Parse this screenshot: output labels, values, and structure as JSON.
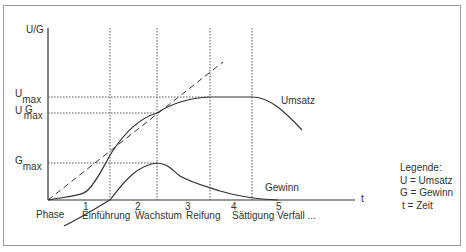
{
  "diagram": {
    "y_axis_label": "U/G",
    "x_axis_label": "t",
    "y_markers": [
      {
        "main": "U",
        "sub": "max"
      },
      {
        "main": "U",
        "main2": "G",
        "sub": "max"
      },
      {
        "main": "G",
        "sub": "max"
      }
    ],
    "phase_label": "Phase",
    "phases": [
      {
        "num": "1",
        "name": "Einführung"
      },
      {
        "num": "2",
        "name": "Wachstum"
      },
      {
        "num": "3",
        "name": "Reifung"
      },
      {
        "num": "4",
        "name": "Sättigung"
      },
      {
        "num": "5",
        "name": "Verfall ..."
      }
    ],
    "curve_labels": {
      "umsatz": "Umsatz",
      "gewinn": "Gewinn"
    },
    "legend": {
      "title": "Legende:",
      "items": [
        "U = Umsatz",
        "G = Gewinn",
        "t = Zeit"
      ]
    },
    "colors": {
      "line": "#333333",
      "frame": "#9a9a9a"
    }
  }
}
